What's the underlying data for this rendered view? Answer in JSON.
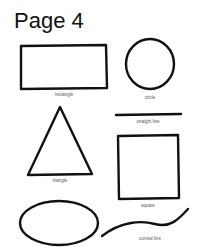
{
  "page": {
    "title": "Page 4"
  },
  "shapes": [
    {
      "name": "rectangle",
      "label": "rectangle"
    },
    {
      "name": "circle",
      "label": "circle"
    },
    {
      "name": "straight-line",
      "label": "straight line"
    },
    {
      "name": "triangle",
      "label": "triangle"
    },
    {
      "name": "square",
      "label": "square"
    },
    {
      "name": "oval",
      "label": ""
    },
    {
      "name": "curved-line",
      "label": "curved line"
    }
  ],
  "colors": {
    "stroke": "#111111",
    "background": "#ffffff"
  }
}
